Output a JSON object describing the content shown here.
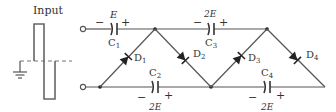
{
  "input": {
    "label": "Input"
  },
  "capacitors": [
    {
      "name": "C1",
      "letter": "C",
      "sub": "1",
      "voltage": "E",
      "minus": "−",
      "plus": "+"
    },
    {
      "name": "C2",
      "letter": "C",
      "sub": "2",
      "voltage": "2E",
      "minus": "−",
      "plus": "+"
    },
    {
      "name": "C3",
      "letter": "C",
      "sub": "3",
      "voltage": "2E",
      "minus": "−",
      "plus": "+"
    },
    {
      "name": "C4",
      "letter": "C",
      "sub": "4",
      "voltage": "2E",
      "minus": "−",
      "plus": "+"
    }
  ],
  "diodes": [
    {
      "name": "D1",
      "letter": "D",
      "sub": "1"
    },
    {
      "name": "D2",
      "letter": "D",
      "sub": "2"
    },
    {
      "name": "D3",
      "letter": "D",
      "sub": "3"
    },
    {
      "name": "D4",
      "letter": "D",
      "sub": "4"
    }
  ],
  "colors": {
    "wire": "#555555",
    "component": "#222222",
    "background": "#ffffff"
  }
}
